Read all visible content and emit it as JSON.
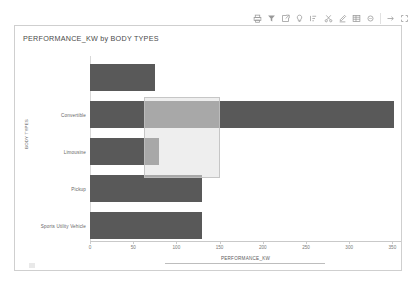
{
  "toolbar": {
    "items": [
      {
        "name": "print-icon",
        "glyph": "⎙",
        "label": "Print"
      },
      {
        "name": "filter-icon",
        "glyph": "▼",
        "label": "Filter"
      },
      {
        "name": "export-icon",
        "glyph": "↗",
        "label": "Export"
      },
      {
        "name": "bulb-icon",
        "glyph": "○",
        "label": "Insights"
      },
      {
        "name": "sort-icon",
        "glyph": "↑",
        "label": "Sort"
      },
      {
        "name": "cut-icon",
        "glyph": "✂",
        "label": "Cut"
      },
      {
        "name": "edit-icon",
        "glyph": "✎",
        "label": "Edit"
      },
      {
        "name": "table-icon",
        "glyph": "▤",
        "label": "Show data"
      },
      {
        "name": "more-options-icon",
        "glyph": "⋯",
        "label": "More options"
      },
      {
        "name": "focus-mode-icon",
        "glyph": "↗",
        "label": "Focus mode"
      },
      {
        "name": "expand-icon",
        "glyph": "⤢",
        "label": "Expand"
      }
    ]
  },
  "chart_data": {
    "type": "bar",
    "orientation": "horizontal",
    "title": "PERFORMANCE_KW by BODY TYPES",
    "xlabel": "PERFORMANCE_KW",
    "ylabel": "BODY TYPES",
    "categories": [
      "",
      "Convertible",
      "Limousine",
      "Pickup",
      "Sports Utility Vehicle"
    ],
    "values": [
      75,
      352,
      80,
      130,
      130
    ],
    "xlim": [
      0,
      360
    ],
    "xticks": [
      0,
      50,
      100,
      150,
      200,
      250,
      300,
      350
    ],
    "xticklabels": [
      "0",
      "50",
      "100",
      "150",
      "200",
      "250",
      "300",
      "350"
    ],
    "grid": false,
    "legend": false,
    "bar_color": "#595959",
    "background": "#ffffff"
  },
  "selection": {
    "name": "selection-marquee",
    "x_start_value": 62,
    "x_end_value": 150,
    "fill": "#e1e1e1",
    "stroke": "#bebebe"
  }
}
